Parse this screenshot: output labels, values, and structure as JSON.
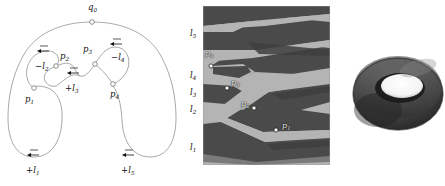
{
  "figure": {
    "title": "",
    "panels": [
      {
        "id": "curve-diagram",
        "name": "labeled-curve-diagram"
      },
      {
        "id": "fractal-image",
        "name": "laminar-fractal-image"
      },
      {
        "id": "torus-image",
        "name": "rendered-torus"
      }
    ]
  },
  "panel_a": {
    "name": "curve-diagram",
    "base_point": {
      "label_text": "q",
      "sub": "0",
      "x": 91,
      "y": 14,
      "marker_x": 92,
      "marker_y": 22
    },
    "points": [
      {
        "id": "p1",
        "label_text": "p",
        "sub": "1",
        "x": 27,
        "y": 100,
        "marker_x": 34,
        "marker_y": 88
      },
      {
        "id": "p2",
        "label_text": "p",
        "sub": "2",
        "x": 60,
        "y": 57,
        "marker_x": 56,
        "marker_y": 66
      },
      {
        "id": "p3",
        "label_text": "p",
        "sub": "3",
        "x": 84,
        "y": 50,
        "marker_x": 95,
        "marker_y": 64
      },
      {
        "id": "p4",
        "label_text": "p",
        "sub": "4",
        "x": 113,
        "y": 96,
        "marker_x": 113,
        "marker_y": 84
      }
    ],
    "arrow_labels": [
      {
        "id": "l1",
        "sign": "+",
        "label_text": "l",
        "sub": "1",
        "x": 29,
        "y": 172,
        "arrow_x": 34,
        "arrow_y": 158
      },
      {
        "id": "l2",
        "sign": "−",
        "label_text": "l",
        "sub": "2",
        "x": 39,
        "y": 68,
        "arrow_x": 44,
        "arrow_y": 54
      },
      {
        "id": "l3",
        "sign": "+",
        "label_text": "l",
        "sub": "3",
        "x": 68,
        "y": 90,
        "arrow_x": 74,
        "arrow_y": 76
      },
      {
        "id": "l4",
        "sign": "−",
        "label_text": "l",
        "sub": "4",
        "x": 115,
        "y": 59,
        "arrow_x": 117,
        "arrow_y": 46
      },
      {
        "id": "l5",
        "sign": "+",
        "label_text": "l",
        "sub": "5",
        "x": 124,
        "y": 172,
        "arrow_x": 129,
        "arrow_y": 158
      }
    ],
    "stroke_color": "#8c8c8c",
    "marker_fill": "#ffffff",
    "arrow_color": "#111111"
  },
  "panel_b": {
    "name": "laminar-fractal-image",
    "frame": {
      "x": 203,
      "y": 6,
      "width": 127,
      "height": 159
    },
    "band_labels": [
      {
        "id": "l5",
        "label_text": "l",
        "sub": "5",
        "x": 191,
        "y": 34
      },
      {
        "id": "l4",
        "label_text": "l",
        "sub": "4",
        "x": 191,
        "y": 76
      },
      {
        "id": "l3",
        "label_text": "l",
        "sub": "3",
        "x": 191,
        "y": 93
      },
      {
        "id": "l2",
        "label_text": "l",
        "sub": "2",
        "x": 191,
        "y": 110
      },
      {
        "id": "l1",
        "label_text": "l",
        "sub": "1",
        "x": 191,
        "y": 148
      }
    ],
    "points": [
      {
        "id": "p4",
        "label_text": "p",
        "sub": "4",
        "label_x": 208,
        "label_y": 55,
        "marker_x": 211,
        "marker_y": 66
      },
      {
        "id": "p3",
        "label_text": "p",
        "sub": "3",
        "label_x": 233,
        "label_y": 83,
        "marker_x": 227,
        "marker_y": 88
      },
      {
        "id": "p2",
        "label_text": "p",
        "sub": "2",
        "label_x": 241,
        "label_y": 104,
        "marker_x": 254,
        "marker_y": 108
      },
      {
        "id": "p1",
        "label_text": "p",
        "sub": "1",
        "label_x": 281,
        "label_y": 126,
        "marker_x": 276,
        "marker_y": 130
      }
    ],
    "colors": {
      "light": "#b4b4b4",
      "dark": "#4a4a4a",
      "border": "#9a9a9a"
    }
  },
  "panel_c": {
    "name": "rendered-torus",
    "frame": {
      "x": 352,
      "y": 38,
      "width": 93,
      "height": 112
    },
    "colors": {
      "outer": "#3c3c3c",
      "mid": "#6e6e6e",
      "shadow": "#232323",
      "hole": "#ffffff"
    }
  }
}
